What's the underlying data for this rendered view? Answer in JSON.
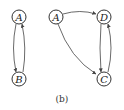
{
  "diagram": {
    "caption": "(b)",
    "graphs": [
      {
        "nodes": [
          {
            "id": "A",
            "label": "A",
            "x": 19,
            "y": 17
          },
          {
            "id": "B",
            "label": "B",
            "x": 19,
            "y": 79
          }
        ],
        "edges": [
          {
            "from": "A",
            "to": "B"
          },
          {
            "from": "B",
            "to": "A"
          }
        ]
      },
      {
        "nodes": [
          {
            "id": "A",
            "label": "A",
            "x": 56,
            "y": 17
          },
          {
            "id": "D",
            "label": "D",
            "x": 104,
            "y": 17
          },
          {
            "id": "C",
            "label": "C",
            "x": 104,
            "y": 79
          }
        ],
        "edges": [
          {
            "from": "A",
            "to": "D"
          },
          {
            "from": "A",
            "to": "C"
          },
          {
            "from": "D",
            "to": "C"
          },
          {
            "from": "C",
            "to": "D"
          }
        ]
      }
    ]
  }
}
